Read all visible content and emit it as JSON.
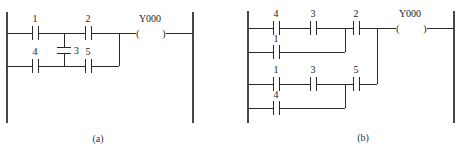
{
  "figure": {
    "panels": [
      {
        "id": "a",
        "caption": "(a)",
        "coil": {
          "label": "Y000"
        },
        "contacts": [
          {
            "label": "1",
            "rung": 1
          },
          {
            "label": "2",
            "rung": 1
          },
          {
            "label": "3",
            "orientation": "vertical"
          },
          {
            "label": "4",
            "rung": 2
          },
          {
            "label": "5",
            "rung": 2
          }
        ]
      },
      {
        "id": "b",
        "caption": "(b)",
        "coil": {
          "label": "Y000"
        },
        "contacts": [
          {
            "label": "4",
            "rung": 1
          },
          {
            "label": "3",
            "rung": 1
          },
          {
            "label": "2",
            "rung": 1
          },
          {
            "label": "1",
            "rung": 2
          },
          {
            "label": "1",
            "rung": 3
          },
          {
            "label": "3",
            "rung": 3
          },
          {
            "label": "5",
            "rung": 3
          },
          {
            "label": "4",
            "rung": 4
          }
        ]
      }
    ]
  }
}
